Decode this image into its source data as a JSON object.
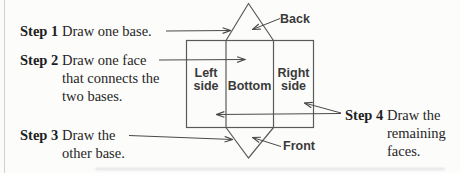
{
  "steps": [
    {
      "label": "Step 1",
      "lines": [
        "Draw one base."
      ]
    },
    {
      "label": "Step 2",
      "lines": [
        "Draw one face",
        "that connects the",
        "two bases."
      ]
    },
    {
      "label": "Step 3",
      "lines": [
        "Draw the",
        "other base."
      ]
    },
    {
      "label": "Step 4",
      "lines": [
        "Draw the",
        "remaining",
        "faces."
      ]
    }
  ],
  "net_labels": {
    "left_line1": "Left",
    "left_line2": "side",
    "bottom": "Bottom",
    "right_line1": "Right",
    "right_line2": "side",
    "back": "Back",
    "front": "Front"
  },
  "colors": {
    "background": "#fcfcfb",
    "line": "#4a4a4a",
    "shape_stroke": "#5a5a5a",
    "step_text": "#262626",
    "face_label_text": "#3a3a3a"
  }
}
